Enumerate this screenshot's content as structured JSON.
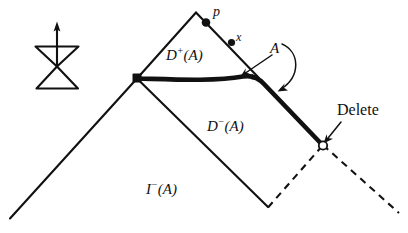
{
  "figure": {
    "title_present": false,
    "background_color": "#ffffff",
    "ink_color": "#111111",
    "labels": {
      "point_p": "p",
      "point_x": "x",
      "region_d_plus": "D",
      "region_d_plus_sup": "+",
      "region_d_plus_arg": "(A)",
      "region_d_minus": "D",
      "region_d_minus_sup": "−",
      "region_d_minus_arg": "(A)",
      "region_i_minus": "I",
      "region_i_minus_sup": "−",
      "region_i_minus_arg": "(A)",
      "arc_label_a": "A",
      "delete_label": "Delete"
    },
    "icon": {
      "name": "bowtie-up-arrow-icon",
      "description": "hourglass / bowtie of two triangles with vertical up arrow"
    },
    "geometry": {
      "apex_peak": [
        196,
        12
      ],
      "junction_node": [
        137,
        78
      ],
      "point_p": [
        206,
        22
      ],
      "point_x": [
        232,
        43
      ],
      "delete_node": [
        323,
        145
      ],
      "valley_bottom": [
        268,
        207
      ],
      "left_slope_end": [
        10,
        218
      ],
      "dashed_left_end": [
        282,
        196
      ],
      "dashed_right_end": [
        398,
        213
      ]
    },
    "line_styles": {
      "solid_thin": "solid thin black",
      "solid_thick": "solid thick black curve",
      "dashed": "dashed black"
    }
  }
}
